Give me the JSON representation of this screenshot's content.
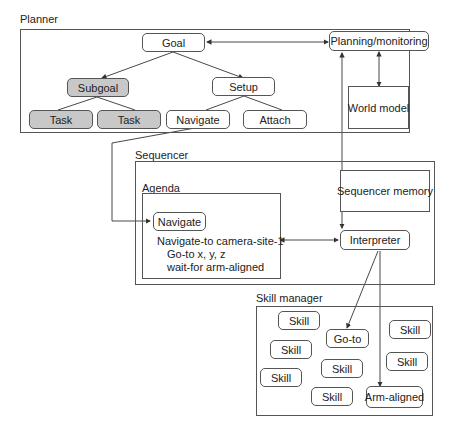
{
  "planner": {
    "label": "Planner",
    "goal": "Goal",
    "subgoal": "Subgoal",
    "setup": "Setup",
    "task1": "Task",
    "task2": "Task",
    "navigate": "Navigate",
    "attach": "Attach",
    "planning_monitoring": "Planning/monitoring",
    "world_model": "World model"
  },
  "sequencer": {
    "label": "Sequencer",
    "memory": "Sequencer memory",
    "interpreter": "Interpreter",
    "agenda": {
      "label": "Agenda",
      "navigate": "Navigate",
      "lines": [
        "Navigate-to camera-site-1",
        "Go-to x, y, z",
        "wait-for arm-aligned"
      ]
    }
  },
  "skill_manager": {
    "label": "Skill manager",
    "skills": [
      "Skill",
      "Skill",
      "Skill",
      "Skill",
      "Skill",
      "Skill",
      "Skill"
    ],
    "goto": "Go-to",
    "arm_aligned": "Arm-aligned"
  },
  "colors": {
    "line": "#333333",
    "frame": "#555555",
    "highlight": "#c8c8c8"
  }
}
